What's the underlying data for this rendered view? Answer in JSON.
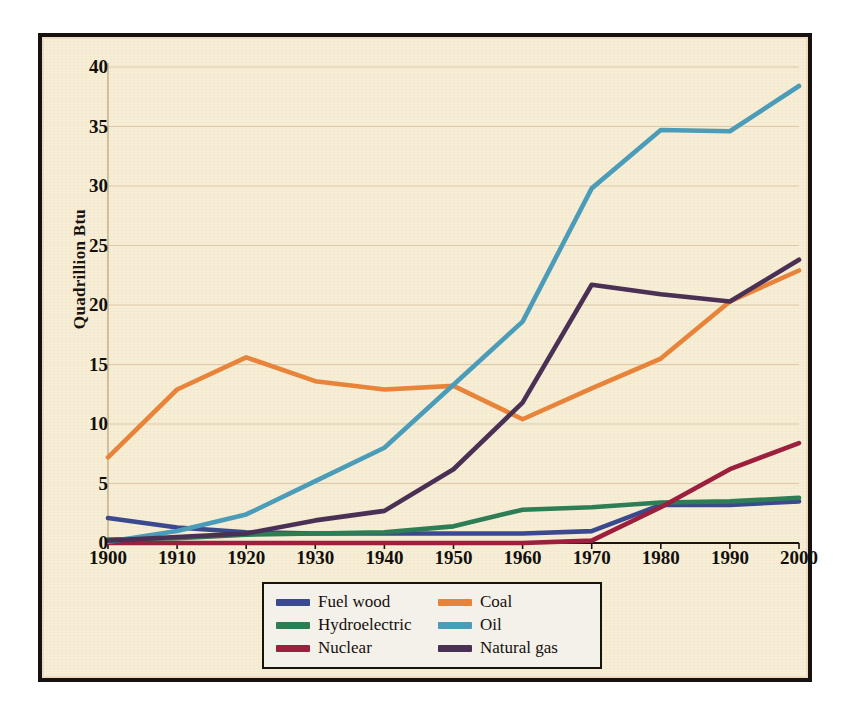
{
  "figure": {
    "background_color": "#f7eed6",
    "frame_color": "#151210",
    "grid_color": "#ddc9a8",
    "axis_color": "#c9b48f"
  },
  "chart_data": {
    "type": "line",
    "title": "",
    "xlabel": "",
    "ylabel": "Quadrillion Btu",
    "x": [
      1900,
      1910,
      1920,
      1930,
      1940,
      1950,
      1960,
      1970,
      1980,
      1990,
      2000
    ],
    "xlim": [
      1900,
      2000
    ],
    "ylim": [
      0,
      40
    ],
    "yticks": [
      0,
      5,
      10,
      15,
      20,
      25,
      30,
      35,
      40
    ],
    "xticks": [
      1900,
      1910,
      1920,
      1930,
      1940,
      1950,
      1960,
      1970,
      1980,
      1990,
      2000
    ],
    "grid": true,
    "legend_position": "bottom-center",
    "series": [
      {
        "name": "Fuel wood",
        "color": "#3b4a8e",
        "values": [
          2.1,
          1.3,
          0.9,
          0.8,
          0.8,
          0.8,
          0.8,
          1.0,
          3.2,
          3.2,
          3.5
        ]
      },
      {
        "name": "Hydroelectric",
        "color": "#2d7d55",
        "values": [
          0.3,
          0.4,
          0.7,
          0.8,
          0.9,
          1.4,
          2.8,
          3.0,
          3.4,
          3.5,
          3.8
        ]
      },
      {
        "name": "Nuclear",
        "color": "#9d1f3e",
        "values": [
          0,
          0,
          0,
          0,
          0,
          0,
          0,
          0.2,
          3.0,
          6.2,
          8.4
        ]
      },
      {
        "name": "Coal",
        "color": "#e8833a",
        "values": [
          7.2,
          12.9,
          15.6,
          13.6,
          12.9,
          13.2,
          10.4,
          13.0,
          15.5,
          20.3,
          22.9
        ]
      },
      {
        "name": "Oil",
        "color": "#4a9cb8",
        "values": [
          0.1,
          1.0,
          2.4,
          5.2,
          8.0,
          13.3,
          18.6,
          29.8,
          34.7,
          34.6,
          38.4
        ]
      },
      {
        "name": "Natural gas",
        "color": "#4a3055",
        "values": [
          0.2,
          0.5,
          0.8,
          1.9,
          2.7,
          6.2,
          11.8,
          21.7,
          20.9,
          20.3,
          23.8
        ]
      }
    ]
  },
  "legend": {
    "entries": [
      {
        "label": "Fuel wood",
        "color": "#3b4a8e"
      },
      {
        "label": "Coal",
        "color": "#e8833a"
      },
      {
        "label": "Hydroelectric",
        "color": "#2d7d55"
      },
      {
        "label": "Oil",
        "color": "#4a9cb8"
      },
      {
        "label": "Nuclear",
        "color": "#9d1f3e"
      },
      {
        "label": "Natural gas",
        "color": "#4a3055"
      }
    ]
  }
}
